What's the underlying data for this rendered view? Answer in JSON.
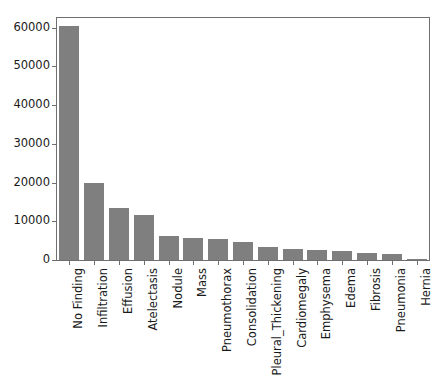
{
  "chart_data": {
    "type": "bar",
    "title": "",
    "xlabel": "",
    "ylabel": "",
    "grid": false,
    "legend": "none",
    "bar_color": "#7f7f7f",
    "axis_color": "#6f6f6f",
    "text_color": "#1a1a1a",
    "ylim": [
      0,
      62500
    ],
    "ytick_labels": [
      "0",
      "10000",
      "20000",
      "30000",
      "40000",
      "50000",
      "60000"
    ],
    "ytick_values": [
      0,
      10000,
      20000,
      30000,
      40000,
      50000,
      60000
    ],
    "categories": [
      "No Finding",
      "Infiltration",
      "Effusion",
      "Atelectasis",
      "Nodule",
      "Mass",
      "Pneumothorax",
      "Consolidation",
      "Pleural_Thickening",
      "Cardiomegaly",
      "Emphysema",
      "Edema",
      "Fibrosis",
      "Pneumonia",
      "Hernia"
    ],
    "values": [
      60361,
      19894,
      13317,
      11559,
      6331,
      5782,
      5302,
      4667,
      3385,
      2776,
      2516,
      2303,
      1686,
      1431,
      227
    ]
  }
}
